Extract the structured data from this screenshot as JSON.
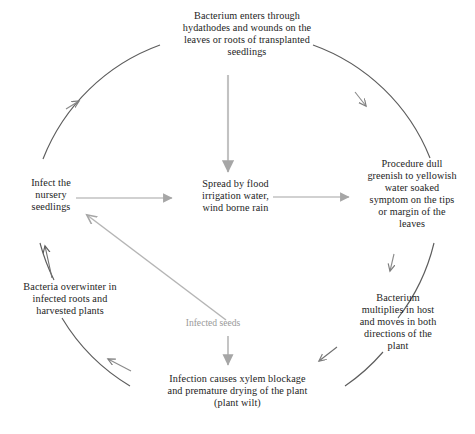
{
  "diagram": {
    "type": "disease-cycle",
    "colors": {
      "text": "#1d1d1d",
      "ring_arc": "#5d5d5d",
      "inner_arrow": "#9a9a9a",
      "light_label": "#9a9a9a",
      "background": "#ffffff"
    },
    "nodes": {
      "entry": "Bacterium enters through\nhydathodes and wounds on the\nleaves or roots of transplanted\nseedlings",
      "spread": "Spread by flood\nirrigation water,\nwind borne rain",
      "symptom": "Procedure dull\ngreenish to yellowish\nwater soaked\nsymptom on the tips\nor margin of the\nleaves",
      "multiply": "Bacterium\nmultiplies in host\nand moves in both\ndirections of the\nplant",
      "wilt": "Infection causes xylem blockage\nand premature drying of the plant\n(plant wilt)",
      "overwinter": "Bacteria overwinter in\ninfected roots and\nharvested plants",
      "infect": "Infect the\nnursery\nseedlings"
    },
    "labels": {
      "infected_seeds": "Infected seeds"
    },
    "edges": [
      {
        "from": "entry",
        "to": "symptom",
        "style": "arc",
        "direction": "clockwise"
      },
      {
        "from": "symptom",
        "to": "multiply",
        "style": "arc",
        "direction": "clockwise"
      },
      {
        "from": "multiply",
        "to": "wilt",
        "style": "arc",
        "direction": "clockwise"
      },
      {
        "from": "wilt",
        "to": "overwinter",
        "style": "arc",
        "direction": "clockwise"
      },
      {
        "from": "overwinter",
        "to": "infect",
        "style": "arc",
        "direction": "clockwise"
      },
      {
        "from": "infect",
        "to": "entry",
        "style": "arc",
        "direction": "clockwise"
      },
      {
        "from": "entry",
        "to": "spread",
        "style": "straight",
        "direction": "down"
      },
      {
        "from": "infect",
        "to": "spread",
        "style": "straight",
        "direction": "right"
      },
      {
        "from": "spread",
        "to": "symptom",
        "style": "straight",
        "direction": "right"
      },
      {
        "from": "infected_seeds",
        "to": "wilt",
        "style": "straight",
        "direction": "down"
      },
      {
        "from": "infected_seeds",
        "to": "infect",
        "style": "straight",
        "direction": "up-left"
      }
    ]
  }
}
